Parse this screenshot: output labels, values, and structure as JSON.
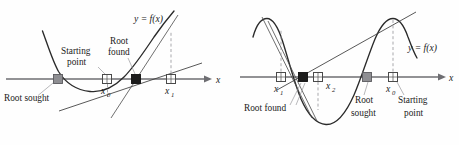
{
  "figure": {
    "axis_label": "x",
    "panels": [
      {
        "id": "left-panel",
        "function_label": "y = f(x)",
        "curve_type": "parabola",
        "axis": {
          "y": 79,
          "x_start": 6,
          "x_end": 205,
          "arrow_tip": 209
        },
        "labels": [
          {
            "name": "root-sought",
            "text": "Root sought",
            "x": 4,
            "y": 101
          },
          {
            "name": "starting-point",
            "text": "Starting",
            "x": 61,
            "y": 54
          },
          {
            "name": "starting-point-2",
            "text": "point",
            "x": 67,
            "y": 65
          },
          {
            "name": "root-found",
            "text": "Root",
            "x": 110,
            "y": 44
          },
          {
            "name": "root-found-2",
            "text": "found",
            "x": 108,
            "y": 55
          }
        ],
        "points": [
          {
            "name": "root-sought-marker",
            "style": "gray",
            "x": 58,
            "label": ""
          },
          {
            "name": "x0-marker",
            "style": "open",
            "x": 107,
            "label": "x",
            "sub": "0"
          },
          {
            "name": "root-found-marker",
            "style": "dark",
            "x": 136,
            "label": ""
          },
          {
            "name": "x1-marker",
            "style": "open",
            "x": 171,
            "label": "x",
            "sub": "1"
          }
        ]
      },
      {
        "id": "right-panel",
        "function_label": "y = f(x)",
        "curve_type": "sinusoid",
        "axis": {
          "y": 77,
          "x_start": 240,
          "x_end": 440,
          "arrow_tip": 444
        },
        "labels": [
          {
            "name": "root-found",
            "text": "Root found",
            "x": 244,
            "y": 111
          },
          {
            "name": "root-sought",
            "text": "Root",
            "x": 355,
            "y": 103
          },
          {
            "name": "root-sought-2",
            "text": "sought",
            "x": 351,
            "y": 116
          },
          {
            "name": "starting-point",
            "text": "Starting",
            "x": 398,
            "y": 103
          },
          {
            "name": "starting-point-2",
            "text": "point",
            "x": 404,
            "y": 116
          }
        ],
        "points": [
          {
            "name": "x1-marker",
            "style": "open",
            "x": 281,
            "label": "x",
            "sub": "1"
          },
          {
            "name": "root-found-marker",
            "style": "dark",
            "x": 303,
            "label": ""
          },
          {
            "name": "x2-marker",
            "style": "open",
            "x": 318,
            "label": "x",
            "sub": "2"
          },
          {
            "name": "root-sought-marker",
            "style": "gray",
            "x": 367,
            "label": ""
          },
          {
            "name": "x0-marker",
            "style": "open",
            "x": 393,
            "label": "x",
            "sub": "0"
          }
        ]
      }
    ],
    "colors": {
      "axis": "#6e6e72",
      "curve": "#2a2a2a",
      "marker_gray": "#8e8e92",
      "marker_dark": "#1c1c1c",
      "marker_open": "#ffffff",
      "dashed": "#9a9a9e",
      "background": "#fefefe"
    }
  }
}
